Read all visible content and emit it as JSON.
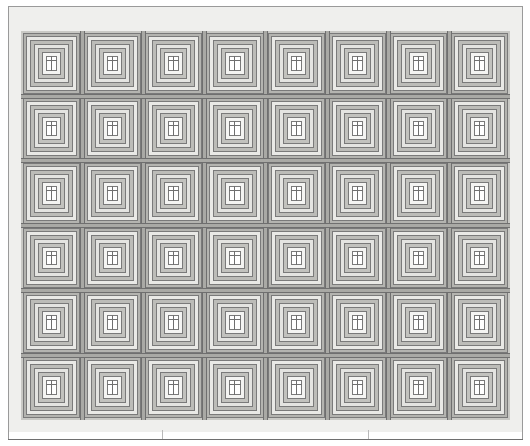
{
  "document": {
    "kind": "quilt-block-layout-diagram",
    "title": "Log Cabin Quilt Layout"
  },
  "canvas": {
    "width": 530,
    "height": 446,
    "background": "#ffffff"
  },
  "page_frame": {
    "name": "page-rule-frame",
    "left": 8,
    "top": 6,
    "width": 515,
    "height": 434,
    "line_color": "#9a9a9a",
    "bottom_line_color": "#6f6f6f"
  },
  "quilt": {
    "border": {
      "label": "outer border",
      "left": 9,
      "top": 7,
      "width": 513,
      "height": 425,
      "fill": "#efefed",
      "width_px": 12
    },
    "field": {
      "label": "pieced field",
      "left": 21,
      "top": 31,
      "width": 489,
      "height": 389,
      "outline": "#6d6d6d",
      "fill": "#d6d6d2"
    },
    "grid": {
      "columns": 8,
      "rows": 6,
      "block_count": 48,
      "block_width": 61.1,
      "block_height": 64.8
    },
    "block": {
      "name": "log-cabin-block",
      "ring_count": 7,
      "ring_colors": [
        "#b4b4b0",
        "#e9e9e6",
        "#bcbcb8",
        "#e4e4e1",
        "#c2c2be",
        "#f4f4f2",
        "#ffffff"
      ],
      "ring_outline": "#7a7a7a",
      "center_fill": "#ffffff",
      "has_center_bars": true
    },
    "sashing": {
      "fill": "#a9a9a5",
      "line": "#6f6f6f",
      "vertical_positions": [
        82,
        143,
        204,
        265,
        327,
        388,
        449
      ],
      "horizontal_positions": [
        96,
        160,
        225,
        290,
        355
      ]
    }
  },
  "ticks": {
    "name": "bottom-measure-ticks",
    "color": "#b9b9b9",
    "positions": [
      162,
      368
    ]
  }
}
